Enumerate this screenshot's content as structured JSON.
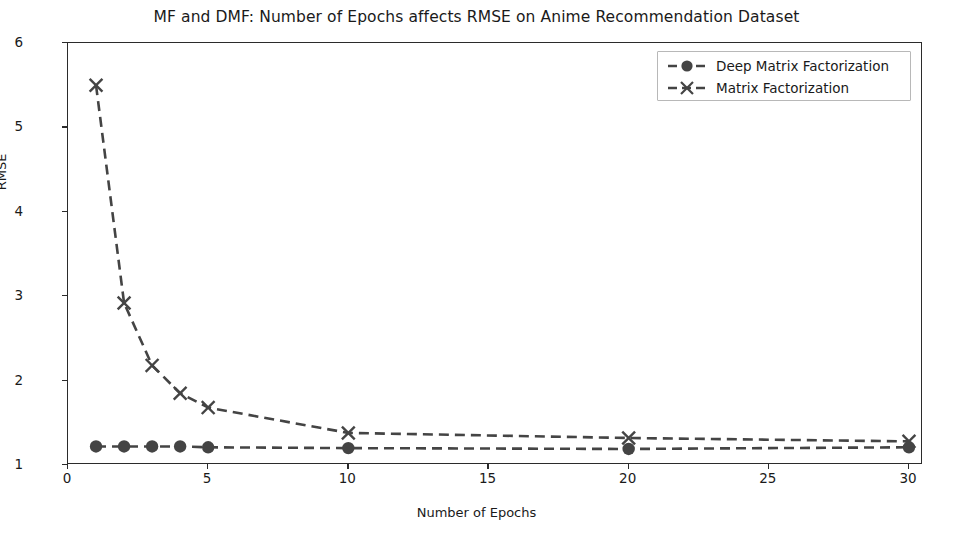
{
  "chart_data": {
    "type": "line",
    "title": "MF and DMF: Number of Epochs affects RMSE on Anime Recommendation Dataset",
    "xlabel": "Number of Epochs",
    "ylabel": "RMSE",
    "xlim": [
      0,
      30.5
    ],
    "ylim": [
      1,
      6
    ],
    "xticks": [
      0,
      5,
      10,
      15,
      20,
      25,
      30
    ],
    "yticks": [
      1,
      2,
      3,
      4,
      5,
      6
    ],
    "grid": false,
    "legend_position": "upper right",
    "series": [
      {
        "name": "Deep Matrix Factorization",
        "marker": "circle",
        "linestyle": "dashed",
        "color": "#444444",
        "x": [
          1,
          2,
          3,
          4,
          5,
          10,
          20,
          30
        ],
        "values": [
          1.22,
          1.22,
          1.22,
          1.22,
          1.21,
          1.2,
          1.19,
          1.21
        ]
      },
      {
        "name": "Matrix Factorization",
        "marker": "x",
        "linestyle": "dashed",
        "color": "#444444",
        "x": [
          1,
          2,
          3,
          4,
          5,
          10,
          20,
          30
        ],
        "values": [
          5.5,
          2.92,
          2.18,
          1.85,
          1.68,
          1.38,
          1.32,
          1.28
        ]
      }
    ]
  },
  "legend": {
    "entries": [
      {
        "label": "Deep Matrix Factorization"
      },
      {
        "label": "Matrix Factorization"
      }
    ]
  },
  "axis": {
    "xticklabels": [
      "0",
      "5",
      "10",
      "15",
      "20",
      "25",
      "30"
    ],
    "yticklabels": [
      "1",
      "2",
      "3",
      "4",
      "5",
      "6"
    ]
  }
}
